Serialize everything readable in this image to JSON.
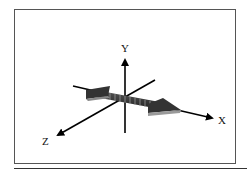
{
  "diagram": {
    "type": "3d-coordinate-axes",
    "axes": {
      "x_label": "X",
      "y_label": "Y",
      "z_label": "Z"
    },
    "object": "double-headed arrow with segmented shaft lying along X-axis direction",
    "colors": {
      "axis": "#000000",
      "arrow_dark": "#333333",
      "arrow_light": "#9a9a9a",
      "frame": "#555555"
    }
  }
}
